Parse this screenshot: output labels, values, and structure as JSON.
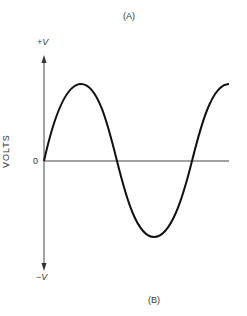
{
  "figure": {
    "top_label": "(A)",
    "bottom_label": "(B)",
    "y_axis_label": "VOLTS",
    "y_max_label": "+V",
    "y_min_label": "−V",
    "zero_label": "0",
    "waveform": "sine wave, ~1.25 cycles starting at 0 rising"
  }
}
